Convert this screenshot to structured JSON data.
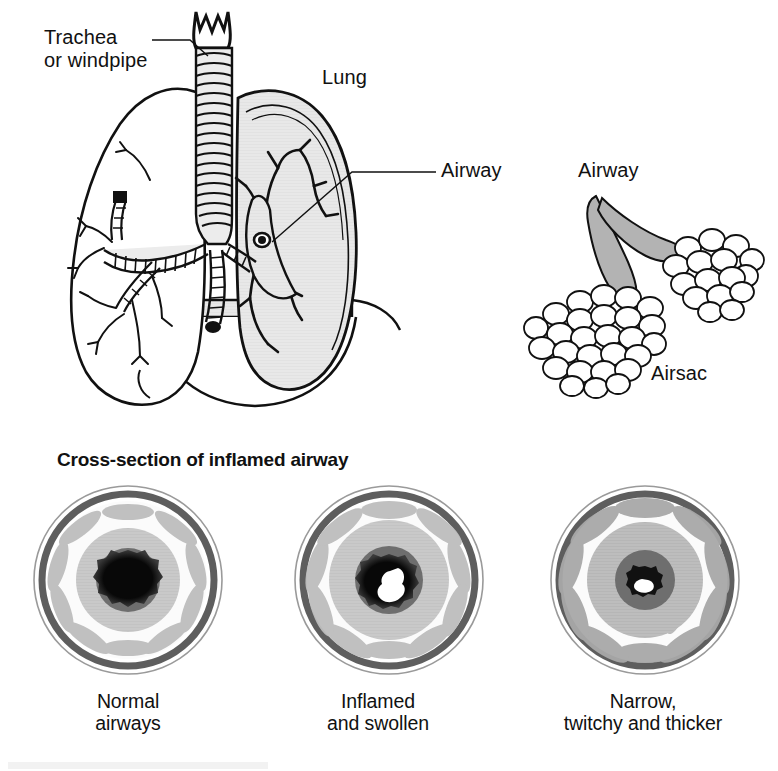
{
  "figure": {
    "title": "Cross-section of inflamed airway",
    "background_color": "#ffffff",
    "ink_color": "#111111"
  },
  "anatomy_labels": [
    {
      "id": "trachea",
      "text": "Trachea\nor windpipe",
      "leader": true
    },
    {
      "id": "lung",
      "text": "Lung",
      "leader": false
    },
    {
      "id": "airway_lung",
      "text": "Airway",
      "leader": true
    },
    {
      "id": "airway_sac",
      "text": "Airway",
      "leader": false
    },
    {
      "id": "airsac",
      "text": "Airsac",
      "leader": false
    }
  ],
  "upper_panel": {
    "trachea_label": "Trachea\nor windpipe",
    "lung_label": "Lung",
    "airway_label": "Airway",
    "airsac_airway_label": "Airway",
    "airsac_label": "Airsac",
    "left_lung_fill": "#ffffff",
    "right_lung_fill": "#e6e6e6",
    "trachea_fill": "#ececec",
    "diaphragm_fill": "#e6e6e6",
    "airway_tube_fill": "#b3b3b3",
    "airsac_fill": "#ffffff"
  },
  "cross_section": {
    "heading": "Cross-section of inflamed airway",
    "colors": {
      "outer_line": "#2b2b2b",
      "adventitia": "#5e5e5e",
      "submucosa_light": "#f2f2f2",
      "muscle_band": "#b9b9b9",
      "mucosa": "#c9c9c9",
      "mucosa_thick": "#b0b0b0",
      "epithelium": "#6e6e6e",
      "lumen": "#080808",
      "mucus": "#ffffff"
    },
    "panels": [
      {
        "id": "normal",
        "caption": "Normal\nairways",
        "caption_line1": "Normal",
        "caption_line2": "airways",
        "lumen_radius_pct": 22,
        "mucosa_radius_pct": 48,
        "wall_state": "thin",
        "has_mucus": false,
        "mucus_size_pct": 0
      },
      {
        "id": "inflamed",
        "caption": "Inflamed\nand swollen",
        "caption_line1": "Inflamed",
        "caption_line2": "and swollen",
        "lumen_radius_pct": 15,
        "mucosa_radius_pct": 55,
        "wall_state": "swollen",
        "has_mucus": true,
        "mucus_size_pct": 8
      },
      {
        "id": "narrow",
        "caption": "Narrow,\ntwitchy and thicker",
        "caption_line1": "Narrow,",
        "caption_line2": "twitchy and thicker",
        "lumen_radius_pct": 8,
        "mucosa_radius_pct": 60,
        "wall_state": "thickened",
        "has_mucus": true,
        "mucus_size_pct": 5
      }
    ]
  }
}
